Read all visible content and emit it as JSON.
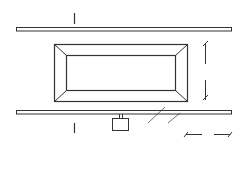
{
  "figure": {
    "caption": "( a )",
    "section_marks": {
      "top": "1",
      "bottom": "1"
    },
    "labels": {
      "pump_station": "3",
      "well_point": "1",
      "header_pipe": "2",
      "dimension_vertical": "B",
      "dimension_horizontal": "B"
    },
    "rails": {
      "top_wells": 24,
      "bottom_wells": 24
    },
    "colors": {
      "line": "#333333",
      "background": "#ffffff"
    }
  }
}
